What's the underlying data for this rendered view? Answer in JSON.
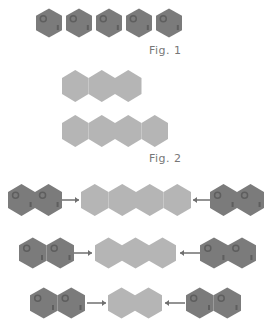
{
  "figures": {
    "fig1": {
      "caption": "Fig. 1",
      "description": "Five separate dark hexagonal tiles"
    },
    "fig2": {
      "caption": "Fig. 2",
      "description": "Joined light hexagon strips of 3 and 4 tiles"
    }
  },
  "colors": {
    "dark_tile": "#7b7b7b",
    "dark_tile_spot": "#5e5e5e",
    "light_tile": "#b5b5b5",
    "arrow": "#6f6f6f",
    "caption": "#777777"
  },
  "rows": [
    {
      "id": "fig1-row",
      "dark_count": 5,
      "joined": false
    },
    {
      "id": "fig2-strip-a",
      "light_count": 3
    },
    {
      "id": "fig2-strip-b",
      "light_count": 4
    },
    {
      "id": "combine-row-1",
      "left_dark": 2,
      "center_light": 4,
      "right_dark": 2
    },
    {
      "id": "combine-row-2",
      "left_dark": 2,
      "center_light": 3,
      "right_dark": 2
    },
    {
      "id": "combine-row-3",
      "left_dark": 2,
      "center_light": 2,
      "right_dark": 2
    }
  ]
}
